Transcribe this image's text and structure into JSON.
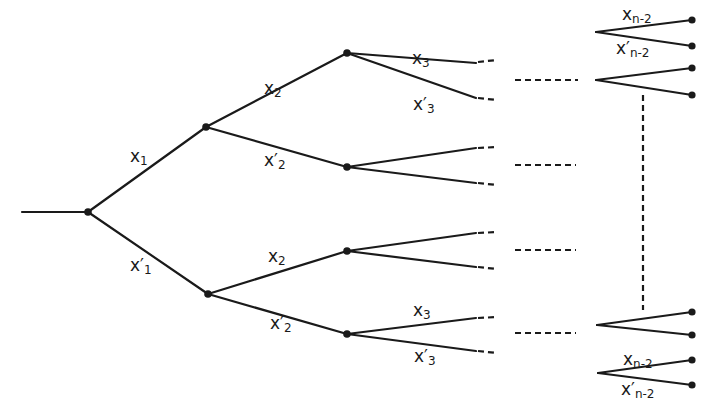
{
  "diagram": {
    "type": "binary-tree",
    "nodes": [
      {
        "id": "root",
        "x": 88,
        "y": 212
      },
      {
        "id": "n1a",
        "x": 206,
        "y": 127
      },
      {
        "id": "n1b",
        "x": 208,
        "y": 294
      },
      {
        "id": "n2a",
        "x": 347,
        "y": 53
      },
      {
        "id": "n2b",
        "x": 347,
        "y": 167
      },
      {
        "id": "n2c",
        "x": 347,
        "y": 251
      },
      {
        "id": "n2d",
        "x": 347,
        "y": 334
      }
    ],
    "edges": [
      {
        "from": [
          22,
          212
        ],
        "to": [
          88,
          212
        ],
        "label": ""
      },
      {
        "from": [
          88,
          212
        ],
        "to": [
          206,
          127
        ],
        "label_key": "x1"
      },
      {
        "from": [
          88,
          212
        ],
        "to": [
          208,
          294
        ],
        "label_key": "x1p"
      },
      {
        "from": [
          206,
          127
        ],
        "to": [
          347,
          53
        ],
        "label_key": "x2"
      },
      {
        "from": [
          206,
          127
        ],
        "to": [
          347,
          167
        ],
        "label_key": "x2p"
      },
      {
        "from": [
          208,
          294
        ],
        "to": [
          347,
          251
        ],
        "label_key": "x2"
      },
      {
        "from": [
          208,
          294
        ],
        "to": [
          347,
          334
        ],
        "label_key": "x2p"
      }
    ],
    "labels": {
      "x1": {
        "base": "x",
        "sub": "1",
        "prime": ""
      },
      "x1p": {
        "base": "x",
        "sub": "1",
        "prime": "′"
      },
      "x2": {
        "base": "x",
        "sub": "2",
        "prime": ""
      },
      "x2p": {
        "base": "x",
        "sub": "2",
        "prime": "′"
      },
      "x3": {
        "base": "x",
        "sub": "3",
        "prime": ""
      },
      "x3p": {
        "base": "x",
        "sub": "3",
        "prime": "′"
      },
      "xn2": {
        "base": "x",
        "sub": "n-2",
        "prime": ""
      },
      "xn2p": {
        "base": "x",
        "sub": "n-2",
        "prime": "′"
      }
    },
    "placed_labels": [
      {
        "key": "x1",
        "left": 130,
        "top": 148
      },
      {
        "key": "x1p",
        "left": 130,
        "top": 257
      },
      {
        "key": "x2",
        "left": 264,
        "top": 80
      },
      {
        "key": "x2p",
        "left": 264,
        "top": 152
      },
      {
        "key": "x3",
        "left": 412,
        "top": 50
      },
      {
        "key": "x3p",
        "left": 413,
        "top": 96
      },
      {
        "key": "x2",
        "left": 268,
        "top": 248
      },
      {
        "key": "x2p",
        "left": 270,
        "top": 315
      },
      {
        "key": "x3",
        "left": 413,
        "top": 302
      },
      {
        "key": "x3p",
        "left": 414,
        "top": 348
      },
      {
        "key": "xn2",
        "left": 622,
        "top": 6
      },
      {
        "key": "xn2p",
        "left": 616,
        "top": 40
      },
      {
        "key": "xn2",
        "left": 623,
        "top": 351
      },
      {
        "key": "xn2p",
        "left": 621,
        "top": 381
      }
    ],
    "continuation": "Dashed lines indicate the omitted intermediate levels between x3 and x(n-2)"
  }
}
